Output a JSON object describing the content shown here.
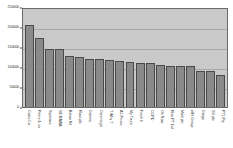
{
  "chart_data": {
    "type": "bar",
    "title": "",
    "xlabel": "",
    "ylabel": "",
    "ylim": [
      0,
      250000
    ],
    "yticks": [
      0,
      50000,
      100000,
      150000,
      200000,
      250000
    ],
    "ytick_labels": [
      "0",
      "50000",
      "100000",
      "150000",
      "200000",
      "250000"
    ],
    "grid": true,
    "legend": "none",
    "categories": [
      "Costs Co",
      "Prime & co",
      "Sysmaxx",
      "SE RAWA",
      "Below Ntl",
      "Ross plc",
      "Grenns",
      "Cars to go",
      "T Why T",
      "A1 Prices",
      "My Tours",
      "Finch It",
      "CCPD",
      "On Now",
      "Rise PT Ltd",
      "Mark plc",
      "eIHi Group",
      "Gregs",
      "SG plc",
      "PT1 Pty"
    ],
    "values": [
      205000,
      173000,
      145000,
      144000,
      128000,
      126000,
      121000,
      119000,
      117000,
      114000,
      112000,
      110000,
      110000,
      105000,
      103000,
      103000,
      102000,
      91000,
      89000,
      81000
    ]
  }
}
